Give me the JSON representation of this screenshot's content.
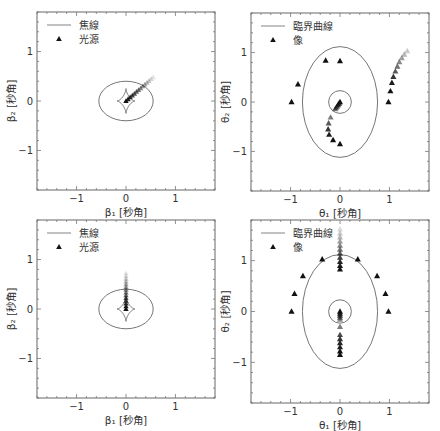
{
  "chart_data": [
    {
      "type": "scatter",
      "panel": "top-left",
      "frame": {
        "x": 37,
        "y": 12,
        "w": 178,
        "h": 178
      },
      "xlim": [
        -1.8,
        1.8
      ],
      "ylim": [
        -1.8,
        1.8
      ],
      "xticks": [
        -1,
        0,
        1
      ],
      "yticks": [
        -1,
        0,
        1
      ],
      "xlabel": "β₁ [秒角]",
      "ylabel": "β₂ [秒角]",
      "legend": [
        {
          "kind": "line",
          "label": "焦線"
        },
        {
          "kind": "marker",
          "label": "光源"
        }
      ],
      "curves": [
        {
          "kind": "ellipse",
          "cx": 0,
          "cy": 0,
          "rx": 0.55,
          "ry": 0.4
        },
        {
          "kind": "astroid",
          "cx": 0,
          "cy": 0,
          "rx": 0.18,
          "ry": 0.25
        }
      ],
      "sources": {
        "from": [
          0.0,
          0.0
        ],
        "to": [
          0.55,
          0.48
        ],
        "count": 14
      }
    },
    {
      "type": "scatter",
      "panel": "top-right",
      "frame": {
        "x": 251,
        "y": 13,
        "w": 178,
        "h": 178
      },
      "xlim": [
        -1.8,
        1.8
      ],
      "ylim": [
        -1.8,
        1.8
      ],
      "xticks": [
        -1,
        0,
        1
      ],
      "yticks": [
        -1,
        0,
        1
      ],
      "xlabel": "θ₁ [秒角]",
      "ylabel": "θ₂ [秒角]",
      "legend": [
        {
          "kind": "line",
          "label": "臨界曲線"
        },
        {
          "kind": "marker",
          "label": "像"
        }
      ],
      "curves": [
        {
          "kind": "ellipse",
          "cx": 0,
          "cy": 0,
          "rx": 0.76,
          "ry": 1.12
        },
        {
          "kind": "ellipse",
          "cx": 0,
          "cy": 0,
          "rx": 0.23,
          "ry": 0.23
        }
      ],
      "images": [
        {
          "x": -0.98,
          "y": 0.0,
          "a": 1
        },
        {
          "x": -0.85,
          "y": 0.36,
          "a": 1
        },
        {
          "x": -0.29,
          "y": 0.84,
          "a": 1
        },
        {
          "x": 0.0,
          "y": 0.83,
          "a": 1
        },
        {
          "x": 0.98,
          "y": 0.0,
          "a": 1
        },
        {
          "x": 1.02,
          "y": 0.22,
          "a": 1
        },
        {
          "x": 1.05,
          "y": 0.39,
          "a": 0.95
        },
        {
          "x": 1.08,
          "y": 0.51,
          "a": 0.85
        },
        {
          "x": 1.12,
          "y": 0.62,
          "a": 0.7
        },
        {
          "x": 1.16,
          "y": 0.72,
          "a": 0.6
        },
        {
          "x": 1.2,
          "y": 0.81,
          "a": 0.5
        },
        {
          "x": 1.25,
          "y": 0.89,
          "a": 0.4
        },
        {
          "x": 1.3,
          "y": 0.96,
          "a": 0.3
        },
        {
          "x": 1.36,
          "y": 1.03,
          "a": 0.22
        },
        {
          "x": 0.0,
          "y": -0.85,
          "a": 1
        },
        {
          "x": -0.14,
          "y": -0.77,
          "a": 1
        },
        {
          "x": -0.22,
          "y": -0.66,
          "a": 0.95
        },
        {
          "x": -0.24,
          "y": -0.55,
          "a": 0.85
        },
        {
          "x": -0.23,
          "y": -0.43,
          "a": 0.7
        },
        {
          "x": -0.19,
          "y": -0.31,
          "a": 0.55
        },
        {
          "x": 0.0,
          "y": 0.0,
          "a": 1
        },
        {
          "x": -0.02,
          "y": -0.03,
          "a": 0.9
        },
        {
          "x": -0.04,
          "y": -0.06,
          "a": 0.8
        },
        {
          "x": -0.06,
          "y": -0.09,
          "a": 0.7
        },
        {
          "x": -0.08,
          "y": -0.12,
          "a": 0.6
        },
        {
          "x": -0.1,
          "y": -0.14,
          "a": 0.5
        }
      ]
    },
    {
      "type": "scatter",
      "panel": "bottom-left",
      "frame": {
        "x": 37,
        "y": 220,
        "w": 178,
        "h": 178
      },
      "xlim": [
        -1.8,
        1.8
      ],
      "ylim": [
        -1.8,
        1.8
      ],
      "xticks": [
        -1,
        0,
        1
      ],
      "yticks": [
        -1,
        0,
        1
      ],
      "xlabel": "β₁ [秒角]",
      "ylabel": "β₂ [秒角]",
      "legend": [
        {
          "kind": "line",
          "label": "焦線"
        },
        {
          "kind": "marker",
          "label": "光源"
        }
      ],
      "curves": [
        {
          "kind": "ellipse",
          "cx": 0,
          "cy": 0,
          "rx": 0.55,
          "ry": 0.4
        },
        {
          "kind": "astroid",
          "cx": 0,
          "cy": 0,
          "rx": 0.18,
          "ry": 0.25
        }
      ],
      "sources": {
        "from": [
          0.0,
          0.0
        ],
        "to": [
          0.0,
          0.72
        ],
        "count": 14
      }
    },
    {
      "type": "scatter",
      "panel": "bottom-right",
      "frame": {
        "x": 251,
        "y": 220,
        "w": 178,
        "h": 183
      },
      "xlim": [
        -1.8,
        1.8
      ],
      "ylim": [
        -1.8,
        1.8
      ],
      "xticks": [
        -1,
        0,
        1
      ],
      "yticks": [
        -1,
        0,
        1
      ],
      "xlabel": "θ₁ [秒角]",
      "ylabel": "θ₂ [秒角]",
      "legend": [
        {
          "kind": "line",
          "label": "臨界曲線"
        },
        {
          "kind": "marker",
          "label": "像"
        }
      ],
      "curves": [
        {
          "kind": "ellipse",
          "cx": 0,
          "cy": 0,
          "rx": 0.76,
          "ry": 1.12
        },
        {
          "kind": "ellipse",
          "cx": 0,
          "cy": 0,
          "rx": 0.23,
          "ry": 0.23
        }
      ],
      "images": [
        {
          "x": -0.98,
          "y": 0.0,
          "a": 1
        },
        {
          "x": -0.92,
          "y": 0.35,
          "a": 1
        },
        {
          "x": -0.75,
          "y": 0.7,
          "a": 1
        },
        {
          "x": -0.36,
          "y": 1.03,
          "a": 1
        },
        {
          "x": 0.98,
          "y": 0.0,
          "a": 1
        },
        {
          "x": 0.92,
          "y": 0.35,
          "a": 1
        },
        {
          "x": 0.75,
          "y": 0.7,
          "a": 1
        },
        {
          "x": 0.36,
          "y": 1.03,
          "a": 1
        },
        {
          "x": 0.0,
          "y": 0.83,
          "a": 1
        },
        {
          "x": 0.0,
          "y": 0.9,
          "a": 0.95
        },
        {
          "x": 0.0,
          "y": 0.98,
          "a": 0.9
        },
        {
          "x": 0.0,
          "y": 1.06,
          "a": 0.8
        },
        {
          "x": 0.0,
          "y": 1.14,
          "a": 0.7
        },
        {
          "x": 0.0,
          "y": 1.22,
          "a": 0.6
        },
        {
          "x": 0.0,
          "y": 1.3,
          "a": 0.5
        },
        {
          "x": 0.0,
          "y": 1.38,
          "a": 0.4
        },
        {
          "x": 0.0,
          "y": 1.46,
          "a": 0.3
        },
        {
          "x": 0.0,
          "y": 1.54,
          "a": 0.22
        },
        {
          "x": 0.0,
          "y": 1.62,
          "a": 0.15
        },
        {
          "x": 0.0,
          "y": -0.85,
          "a": 1
        },
        {
          "x": 0.0,
          "y": -0.78,
          "a": 1
        },
        {
          "x": 0.0,
          "y": -0.7,
          "a": 0.95
        },
        {
          "x": 0.0,
          "y": -0.62,
          "a": 0.9
        },
        {
          "x": 0.0,
          "y": -0.54,
          "a": 0.85
        },
        {
          "x": 0.0,
          "y": -0.46,
          "a": 0.75
        },
        {
          "x": 0.0,
          "y": -0.3,
          "a": 0.55
        },
        {
          "x": 0.0,
          "y": 0.0,
          "a": 1
        },
        {
          "x": 0.0,
          "y": -0.04,
          "a": 0.9
        },
        {
          "x": 0.0,
          "y": -0.08,
          "a": 0.8
        },
        {
          "x": 0.0,
          "y": -0.12,
          "a": 0.65
        },
        {
          "x": 0.0,
          "y": -0.16,
          "a": 0.5
        }
      ]
    }
  ],
  "style": {
    "curve_color": "#666666",
    "marker_color": "#111111",
    "frame_color": "#666666"
  }
}
